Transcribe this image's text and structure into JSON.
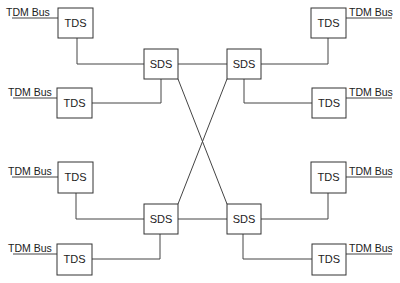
{
  "diagram": {
    "nodes": {
      "tds_tl": {
        "label": "TDS",
        "bus": "TDM Bus"
      },
      "tds_ml": {
        "label": "TDS",
        "bus": "TDM Bus"
      },
      "tds_tr": {
        "label": "TDS",
        "bus": "TDM Bus"
      },
      "tds_mr": {
        "label": "TDS",
        "bus": "TDM Bus"
      },
      "tds_lt": {
        "label": "TDS",
        "bus": "TDM Bus"
      },
      "tds_bl": {
        "label": "TDS",
        "bus": "TDM Bus"
      },
      "tds_rt": {
        "label": "TDS",
        "bus": "TDM Bus"
      },
      "tds_br": {
        "label": "TDS",
        "bus": "TDM Bus"
      },
      "sds_tl": {
        "label": "SDS"
      },
      "sds_tr": {
        "label": "SDS"
      },
      "sds_bl": {
        "label": "SDS"
      },
      "sds_br": {
        "label": "SDS"
      }
    },
    "edges": [
      [
        "tds_tl",
        "sds_tl"
      ],
      [
        "tds_ml",
        "sds_tl"
      ],
      [
        "tds_tr",
        "sds_tr"
      ],
      [
        "tds_mr",
        "sds_tr"
      ],
      [
        "tds_lt",
        "sds_bl"
      ],
      [
        "tds_bl",
        "sds_bl"
      ],
      [
        "tds_rt",
        "sds_br"
      ],
      [
        "tds_br",
        "sds_br"
      ],
      [
        "sds_tl",
        "sds_tr"
      ],
      [
        "sds_bl",
        "sds_br"
      ],
      [
        "sds_tl",
        "sds_br"
      ],
      [
        "sds_tr",
        "sds_bl"
      ]
    ]
  }
}
